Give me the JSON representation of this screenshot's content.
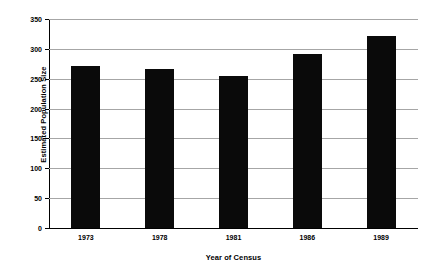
{
  "chart_data": {
    "type": "bar",
    "title": "",
    "xlabel": "Year of Census",
    "ylabel": "Estimated Population Size",
    "categories": [
      "1973",
      "1978",
      "1981",
      "1986",
      "1989"
    ],
    "values": [
      272,
      266,
      255,
      291,
      322
    ],
    "ylim": [
      0,
      350
    ],
    "yticks": [
      0,
      50,
      100,
      150,
      200,
      250,
      300,
      350
    ],
    "ytick_labels": [
      "0",
      "50",
      "100",
      "150",
      "200",
      "250",
      "300",
      "350"
    ],
    "grid": true,
    "legend": null,
    "bar_color": "#0a0a0a",
    "gridline_color": "#a6a6a6",
    "axis_color": "#000000",
    "background_color": "#ffffff"
  }
}
